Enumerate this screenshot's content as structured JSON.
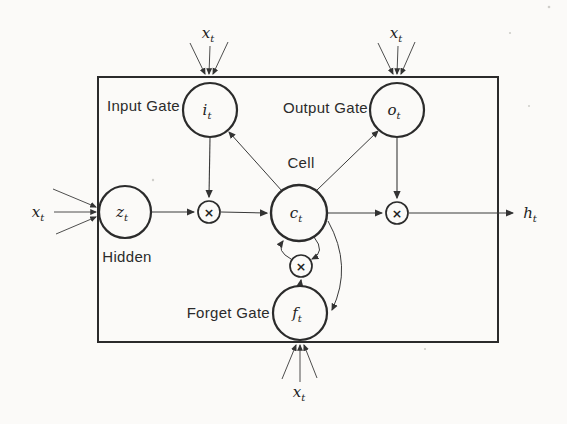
{
  "diagram": {
    "type": "lstm-block-diagram",
    "background": "#fbfaf8",
    "line_color": "#2b2b2b",
    "labels": {
      "input_gate": "Input Gate",
      "output_gate": "Output Gate",
      "forget_gate": "Forget Gate",
      "cell": "Cell",
      "hidden": "Hidden"
    },
    "symbols": {
      "input": {
        "base": "x",
        "sub": "t"
      },
      "output": {
        "base": "h",
        "sub": "t"
      },
      "input_gate": {
        "base": "i",
        "sub": "t"
      },
      "output_gate": {
        "base": "o",
        "sub": "t"
      },
      "cell": {
        "base": "c",
        "sub": "t"
      },
      "forget_gate": {
        "base": "f",
        "sub": "t"
      },
      "hidden": {
        "base": "z",
        "sub": "t"
      }
    },
    "operator": {
      "multiply": "×"
    },
    "structure": {
      "nodes": [
        "hidden (z_t)",
        "input-gate (i_t)",
        "output-gate (o_t)",
        "cell (c_t)",
        "forget-gate (f_t)",
        "multiply-node-input",
        "multiply-node-output",
        "multiply-node-forget"
      ],
      "edges": [
        "x_t (top-left, 3 lines) -> input-gate",
        "x_t (top-right, 3 lines) -> output-gate",
        "x_t (left, 3 lines) -> hidden",
        "x_t (bottom, 3 lines) -> forget-gate",
        "hidden -> multiply-node-input",
        "input-gate -> multiply-node-input",
        "multiply-node-input -> cell",
        "cell -> input-gate",
        "cell -> output-gate",
        "output-gate -> multiply-node-output",
        "cell -> multiply-node-output",
        "multiply-node-output -> h_t",
        "cell -> multiply-node-forget (arc)",
        "multiply-node-forget -> cell (arc)",
        "forget-gate -> multiply-node-forget",
        "cell -> forget-gate (outer arc)"
      ]
    }
  }
}
